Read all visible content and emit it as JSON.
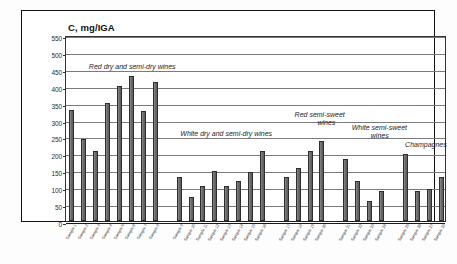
{
  "chart_data": {
    "type": "bar",
    "title": "C, mg/IGA",
    "xlabel": "",
    "ylabel": "C, mg/IGA",
    "ylim": [
      0,
      550
    ],
    "ytick_step": 50,
    "yticks": [
      0,
      50,
      100,
      150,
      200,
      250,
      300,
      350,
      400,
      450,
      500,
      550
    ],
    "grid": true,
    "legend": "none",
    "bar_color": "#6d6d6d",
    "bar_edge_color": "#2e2e2e",
    "groups": [
      {
        "name": "Red dry and semi-dry wines",
        "annotation": "Red dry and semi-dry wines",
        "categories": [
          "Sample 1",
          "Sample 2",
          "Sample 3",
          "Sample 4",
          "Sample 5",
          "Sample 6",
          "Sample 7",
          "Sample 8"
        ],
        "values": [
          328,
          243,
          207,
          348,
          400,
          428,
          324,
          410
        ]
      },
      {
        "name": "White dry and semi-dry wines",
        "annotation": "White dry and semi-dry wines",
        "categories": [
          "Sample 9",
          "Sample 10",
          "Sample 11",
          "Sample 12",
          "Sample 13",
          "Sample 14",
          "Sample 15",
          "Sample 16"
        ],
        "values": [
          130,
          72,
          104,
          148,
          104,
          118,
          145,
          207
        ]
      },
      {
        "name": "Red semi-sweet wines",
        "annotation": "Red  semi-sweet\nwines",
        "categories": [
          "Sample 17",
          "Sample 18",
          "Sample 19",
          "Sample 20"
        ],
        "values": [
          130,
          158,
          206,
          237
        ]
      },
      {
        "name": "White semi-sweet wines",
        "annotation": "White semi-sweet\nwines",
        "categories": [
          "Sample 21",
          "Sample 22",
          "Sample 23",
          "Sample 24"
        ],
        "values": [
          182,
          118,
          60,
          88
        ]
      },
      {
        "name": "Champagnes",
        "annotation": "Champagnes",
        "categories": [
          "Sample 25",
          "Sample 26",
          "Sample 27",
          "Sample 28"
        ],
        "values": [
          198,
          88,
          95,
          130
        ]
      }
    ],
    "annotations": [
      {
        "text": "Red dry and semi-dry wines",
        "x_pct": 6,
        "y_value": 460
      },
      {
        "text": "White dry and semi-dry wines",
        "x_pct": 30,
        "y_value": 262
      },
      {
        "text": "Red  semi-sweet",
        "x_pct": 60,
        "y_value": 318
      },
      {
        "text": "wines",
        "x_pct": 66,
        "y_value": 295
      },
      {
        "text": "White semi-sweet",
        "x_pct": 75,
        "y_value": 282
      },
      {
        "text": "wines",
        "x_pct": 80,
        "y_value": 258
      },
      {
        "text": "Champagnes",
        "x_pct": 89,
        "y_value": 232
      }
    ]
  },
  "axis": {
    "y_labels": [
      "550",
      "500",
      "450",
      "400",
      "350",
      "300",
      "250",
      "200",
      "150",
      "100",
      "50",
      "0"
    ]
  }
}
